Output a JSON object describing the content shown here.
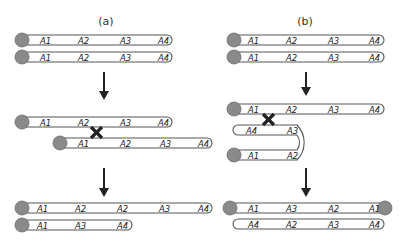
{
  "panels": {
    "a": {
      "title": "(a)",
      "step1": {
        "chromosome1": [
          "A1",
          "A2",
          "A3",
          "A4"
        ],
        "chromosome2": [
          "A1",
          "A2",
          "A3",
          "A4"
        ]
      },
      "step2": {
        "chromosome1": [
          "A1",
          "A2",
          "A3",
          "A4"
        ],
        "chromosome2_shifted": [
          "A1",
          "A2",
          "A3",
          "A4"
        ],
        "crossover_mark": "X"
      },
      "step3": {
        "chromosome1": [
          "A1",
          "A2",
          "A2",
          "A3",
          "A4"
        ],
        "chromosome2": [
          "A1",
          "A3",
          "A4"
        ]
      }
    },
    "b": {
      "title": "(b)",
      "step1": {
        "chromosome1": [
          "A1",
          "A2",
          "A3",
          "A4"
        ],
        "chromosome2": [
          "A1",
          "A2",
          "A3",
          "A4"
        ]
      },
      "step2": {
        "chromosome1": [
          "A1",
          "A2",
          "A3",
          "A4"
        ],
        "looped_upper": [
          "A4",
          "A3"
        ],
        "looped_lower": [
          "A1",
          "A2"
        ],
        "crossover_mark": "X"
      },
      "step3": {
        "dicentric": [
          "A1",
          "A3",
          "A2",
          "A1"
        ],
        "acentric": [
          "A4",
          "A2",
          "A3",
          "A4"
        ]
      }
    }
  },
  "colors": {
    "centromere": "#8a8a8a",
    "outline": "#555555",
    "arrow": "#222222"
  }
}
